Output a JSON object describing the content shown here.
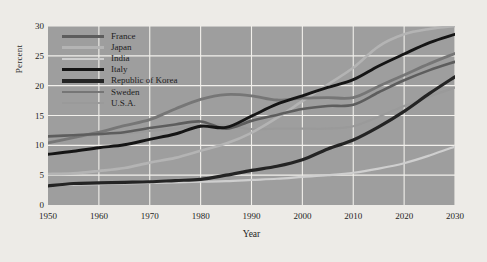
{
  "figure": {
    "background_color": "#edebe7",
    "plot_background_color": "#9e9e9e",
    "grid_color": "#f2f0ec"
  },
  "axis": {
    "ylabel": "Percent",
    "xlabel": "Year",
    "yticks": [
      "0",
      "5",
      "10",
      "15",
      "20",
      "25",
      "30"
    ],
    "xticks": [
      "1950",
      "1960",
      "1970",
      "1980",
      "1990",
      "2000",
      "2010",
      "2020",
      "2030"
    ]
  },
  "legend": {
    "items": [
      {
        "label": "France",
        "color": "#5d5d5d",
        "width": 2.6
      },
      {
        "label": "Japan",
        "color": "#b4b4b4",
        "width": 2.6
      },
      {
        "label": "India",
        "color": "#cfcfcf",
        "width": 2.2
      },
      {
        "label": "Italy",
        "color": "#151515",
        "width": 2.9
      },
      {
        "label": "Republic of Korea",
        "color": "#242424",
        "width": 3.2
      },
      {
        "label": "Sweden",
        "color": "#767676",
        "width": 2.8
      },
      {
        "label": "U.S.A.",
        "color": "#9a9a9a",
        "width": 2.2
      }
    ]
  },
  "chart_data": {
    "type": "line",
    "title": "",
    "xlabel": "Year",
    "ylabel": "Percent",
    "xlim": [
      1950,
      2030
    ],
    "ylim": [
      0,
      30
    ],
    "grid": true,
    "legend_position": "upper-left-inside",
    "x": [
      1950,
      1955,
      1960,
      1965,
      1970,
      1975,
      1980,
      1985,
      1990,
      1995,
      2000,
      2005,
      2010,
      2015,
      2020,
      2025,
      2030
    ],
    "series": [
      {
        "name": "France",
        "color": "#5d5d5d",
        "values": [
          11.5,
          11.7,
          11.9,
          12.2,
          12.9,
          13.5,
          14.0,
          12.8,
          14.1,
          15.1,
          16.1,
          16.6,
          16.8,
          18.9,
          20.9,
          22.6,
          24.0
        ]
      },
      {
        "name": "Japan",
        "color": "#b4b4b4",
        "values": [
          5.2,
          5.3,
          5.7,
          6.2,
          7.1,
          7.9,
          9.1,
          10.3,
          12.1,
          14.6,
          17.4,
          20.2,
          23.0,
          26.6,
          28.6,
          29.5,
          30.0
        ]
      },
      {
        "name": "India",
        "color": "#cfcfcf",
        "values": [
          3.3,
          3.4,
          3.5,
          3.6,
          3.7,
          3.8,
          3.9,
          4.0,
          4.2,
          4.4,
          4.7,
          5.0,
          5.4,
          6.1,
          7.0,
          8.3,
          9.8
        ]
      },
      {
        "name": "Italy",
        "color": "#151515",
        "values": [
          8.5,
          9.0,
          9.6,
          10.1,
          11.0,
          11.9,
          13.2,
          13.0,
          14.9,
          16.9,
          18.3,
          19.7,
          21.0,
          23.3,
          25.3,
          27.2,
          28.6
        ]
      },
      {
        "name": "Republic of Korea",
        "color": "#242424",
        "values": [
          3.2,
          3.6,
          3.7,
          3.8,
          3.9,
          4.1,
          4.3,
          5.0,
          5.8,
          6.5,
          7.6,
          9.4,
          10.9,
          13.1,
          15.7,
          18.7,
          21.5
        ]
      },
      {
        "name": "Sweden",
        "color": "#767676",
        "values": [
          10.4,
          11.3,
          12.2,
          13.3,
          14.3,
          16.1,
          17.7,
          18.5,
          18.3,
          17.6,
          17.9,
          18.0,
          18.0,
          19.9,
          21.8,
          23.7,
          25.4
        ]
      },
      {
        "name": "U.S.A.",
        "color": "#9a9a9a",
        "values": [
          10.7,
          11.3,
          11.8,
          12.0,
          12.4,
          12.8,
          13.4,
          13.4,
          12.7,
          12.8,
          12.8,
          12.8,
          13.2,
          14.8,
          16.6,
          18.2,
          19.7
        ]
      }
    ]
  }
}
